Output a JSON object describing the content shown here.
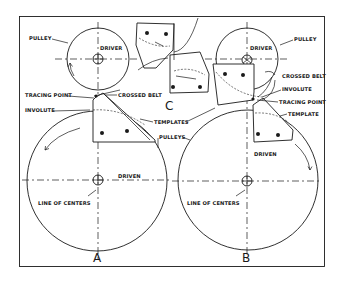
{
  "figure": {
    "panels": [
      {
        "id": "A",
        "label": "A"
      },
      {
        "id": "B",
        "label": "B"
      },
      {
        "id": "C",
        "label": "C"
      }
    ],
    "labels": {
      "pulley_a": "PULLEY",
      "driver_a": "DRIVER",
      "tracing_point_a": "TRACING POINT",
      "crossed_belt_a": "CROSSED BELT",
      "involute_a": "INVOLUTE",
      "templates": "TEMPLATES",
      "pulleys": "PULLEYS",
      "driven_a": "DRIVEN",
      "line_of_centers_a": "LINE OF CENTERS",
      "pulley_b": "PULLEY",
      "driver_b": "DRIVER",
      "crossed_belt_b": "CROSSED BELT",
      "involute_b": "INVOLUTE",
      "tracing_point_b": "TRACING POINT",
      "template_b": "TEMPLATE",
      "driven_b": "DRIVEN",
      "line_of_centers_b": "LINE OF CENTERS"
    },
    "colors": {
      "ink": "#1a1a1a",
      "background": "#ffffff"
    }
  }
}
